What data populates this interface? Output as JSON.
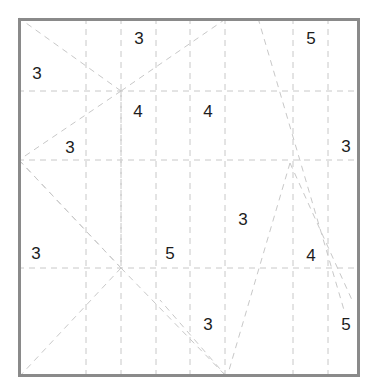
{
  "figure": {
    "kind": "puzzle-grid-diagram",
    "width": 383,
    "height": 391
  },
  "colors": {
    "background": "#ffffff",
    "border": "#8a8a8a",
    "gridline": "#c8c8c8",
    "diagonal": "#c8c8c8",
    "clue_text": "#1c1c1c"
  },
  "board": {
    "left": 18,
    "top": 18,
    "right": 360,
    "bottom": 377,
    "border_width": 3
  },
  "grid": {
    "vertical_lines_x": [
      86,
      121,
      156,
      190,
      225,
      293,
      328
    ],
    "horizontal_lines_y": [
      91,
      160,
      268
    ],
    "dash_pattern": "6 5"
  },
  "diagonals": [
    {
      "name": "hub-a-to-topleft",
      "x1": 121,
      "y1": 91,
      "x2": 19,
      "y2": 18
    },
    {
      "name": "hub-a-to-topright",
      "x1": 121,
      "y1": 91,
      "x2": 227,
      "y2": 18
    },
    {
      "name": "hub-a-to-left-hub",
      "x1": 121,
      "y1": 91,
      "x2": 19,
      "y2": 160
    },
    {
      "name": "hub-a-to-hub-c",
      "x1": 121,
      "y1": 91,
      "x2": 121,
      "y2": 268
    },
    {
      "name": "left-hub-down-right",
      "x1": 19,
      "y1": 160,
      "x2": 121,
      "y2": 268
    },
    {
      "name": "left-hub-to-bottom",
      "x1": 19,
      "y1": 160,
      "x2": 121,
      "y2": 268
    },
    {
      "name": "hub-c-to-bottomleft",
      "x1": 121,
      "y1": 268,
      "x2": 19,
      "y2": 377
    },
    {
      "name": "hub-c-to-bottomright",
      "x1": 121,
      "y1": 268,
      "x2": 227,
      "y2": 377
    },
    {
      "name": "top-right-long-fall",
      "x1": 258,
      "y1": 18,
      "x2": 344,
      "y2": 310
    },
    {
      "name": "peak-left-leg",
      "x1": 290,
      "y1": 163,
      "x2": 227,
      "y2": 377
    },
    {
      "name": "peak-right-leg",
      "x1": 290,
      "y1": 163,
      "x2": 352,
      "y2": 300
    },
    {
      "name": "bottom-hub-left-leg",
      "x1": 227,
      "y1": 377,
      "x2": 160,
      "y2": 300
    }
  ],
  "clues": [
    {
      "id": "clue-1",
      "value": "3",
      "x": 139,
      "y": 38
    },
    {
      "id": "clue-2",
      "value": "5",
      "x": 311,
      "y": 38
    },
    {
      "id": "clue-3",
      "value": "3",
      "x": 37,
      "y": 73
    },
    {
      "id": "clue-4",
      "value": "4",
      "x": 138,
      "y": 111
    },
    {
      "id": "clue-5",
      "value": "4",
      "x": 208,
      "y": 111
    },
    {
      "id": "clue-6",
      "value": "3",
      "x": 70,
      "y": 147
    },
    {
      "id": "clue-7",
      "value": "3",
      "x": 346,
      "y": 146
    },
    {
      "id": "clue-8",
      "value": "3",
      "x": 243,
      "y": 219
    },
    {
      "id": "clue-9",
      "value": "3",
      "x": 36,
      "y": 253
    },
    {
      "id": "clue-10",
      "value": "5",
      "x": 170,
      "y": 253
    },
    {
      "id": "clue-11",
      "value": "4",
      "x": 311,
      "y": 255
    },
    {
      "id": "clue-12",
      "value": "3",
      "x": 208,
      "y": 324
    },
    {
      "id": "clue-13",
      "value": "5",
      "x": 346,
      "y": 324
    }
  ]
}
